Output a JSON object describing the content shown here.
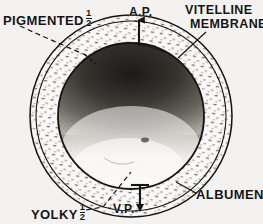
{
  "figure": {
    "background_color": "#f3f2f0",
    "ink_color": "#141414"
  },
  "labels": {
    "pigmented": "PIGMENTED",
    "pigmented_fraction_numerator": "1",
    "pigmented_fraction_denominator": "2",
    "animal_pole": "A.P.",
    "vitelline_line1": "VITELLINE",
    "vitelline_line2": "MEMBRANE",
    "yolky": "YOLKY",
    "yolky_fraction_numerator": "1",
    "yolky_fraction_denominator": "2",
    "vegetal_pole": "V.P.",
    "albumen": "ALBUMEN"
  },
  "geometry": {
    "center_x": 131,
    "center_y": 116,
    "albumen_outer_radius": 101,
    "vitelline_radius": 95,
    "egg_radius": 73,
    "pigment_boundary_y": 132
  },
  "colors": {
    "egg_pigmented_dark": "#2f2d2b",
    "egg_yolky_light": "#f7f6f4",
    "albumen_fill": "#faf9f7",
    "outline": "#141414"
  },
  "leaders": {
    "pigmented_leader": "dashed",
    "vitelline_leader": "solid",
    "albumen_leader": "solid",
    "yolky_leader": "dashed",
    "animal_pole_arrow": "up",
    "vegetal_pole_arrow": "down"
  }
}
